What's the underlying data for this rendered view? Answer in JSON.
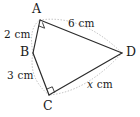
{
  "figure": {
    "type": "geometry-diagram",
    "shape_name": "quadrilateral ABCD",
    "colors": {
      "solid_stroke": "#2b2b2b",
      "dotted_stroke": "#b3b3b3",
      "text": "#1a1a1a",
      "background": "#ffffff"
    },
    "vertices": [
      {
        "id": "A",
        "label": "A",
        "x": 40,
        "y": 20,
        "label_x": 32,
        "label_y": 3,
        "right_angle": true
      },
      {
        "id": "B",
        "label": "B",
        "x": 33,
        "y": 53,
        "label_x": 20,
        "label_y": 46,
        "right_angle": false
      },
      {
        "id": "C",
        "label": "C",
        "x": 49,
        "y": 95,
        "label_x": 43,
        "label_y": 100,
        "right_angle": true
      },
      {
        "id": "D",
        "label": "D",
        "x": 122,
        "y": 53,
        "label_x": 126,
        "label_y": 46,
        "right_angle": false
      }
    ],
    "solid_edges": [
      {
        "from": "A",
        "to": "B"
      },
      {
        "from": "B",
        "to": "C"
      },
      {
        "from": "C",
        "to": "D"
      },
      {
        "from": "A",
        "to": "D"
      }
    ],
    "dotted_edges": [
      {
        "from": "A",
        "to": "D",
        "note": "outer construction arc above AD"
      },
      {
        "from": "C",
        "to": "D",
        "note": "outer construction arc below CD"
      },
      {
        "from": "A",
        "to": "B",
        "note": "outer construction arc left of AB"
      },
      {
        "from": "B",
        "to": "C",
        "note": "outer construction arc left of BC"
      }
    ],
    "measurements": [
      {
        "id": "AB",
        "edge": "A-B",
        "text": "2 cm",
        "value": 2,
        "unit": "cm",
        "x": 4,
        "y": 29
      },
      {
        "id": "AD",
        "edge": "A-D",
        "text": "6 cm",
        "value": 6,
        "unit": "cm",
        "x": 68,
        "y": 18
      },
      {
        "id": "BC",
        "edge": "B-C",
        "text": "3 cm",
        "value": 3,
        "unit": "cm",
        "x": 7,
        "y": 70
      },
      {
        "id": "CD",
        "edge": "C-D",
        "text": "x cm",
        "variable": "x",
        "unit": "cm",
        "x": 87,
        "y": 79
      }
    ]
  }
}
